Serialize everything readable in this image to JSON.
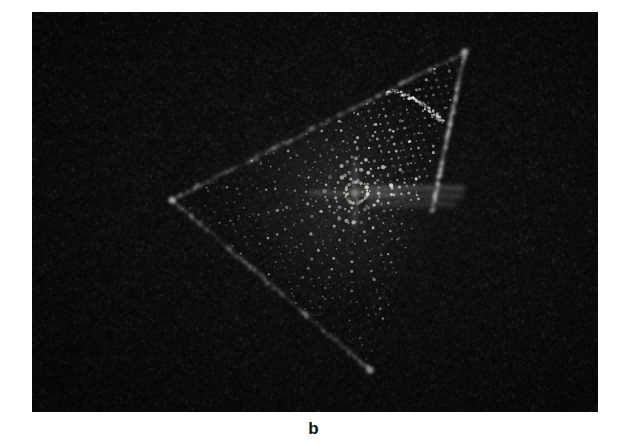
{
  "figure": {
    "panel_label": "b",
    "caption_position": "below-image",
    "background_color": "#fefefe",
    "plate": {
      "background_color": "#050505",
      "x": 32,
      "y": 12,
      "width": 566,
      "height": 400,
      "description": "electron diffraction pattern photographic plate"
    }
  },
  "chart_data": {
    "type": "scatter",
    "title": "",
    "subtitle": "",
    "xlabel": "",
    "ylabel": "",
    "grid": false,
    "legend": null,
    "annotations": [],
    "axis_ranges": {
      "x": [
        0,
        566
      ],
      "y": [
        0,
        400
      ]
    },
    "pattern": {
      "triangle_vertices_px": [
        [
          433,
          40
        ],
        [
          140,
          188
        ],
        [
          338,
          358
        ]
      ],
      "center_px": [
        323,
        181
      ],
      "bright_horizontal_streaks_px": [
        {
          "x1": 330,
          "y1": 176,
          "x2": 432,
          "y2": 176,
          "intensity": 0.8
        },
        {
          "x1": 332,
          "y1": 184,
          "x2": 430,
          "y2": 184,
          "intensity": 0.62
        },
        {
          "x1": 336,
          "y1": 192,
          "x2": 424,
          "y2": 192,
          "intensity": 0.5
        }
      ],
      "bright_edges": [
        {
          "name": "upper-left-edge",
          "from": [
            140,
            188
          ],
          "to": [
            433,
            40
          ],
          "intensity": 0.55
        },
        {
          "name": "right-edge",
          "from": [
            433,
            40
          ],
          "to": [
            400,
            200
          ],
          "intensity": 0.7
        },
        {
          "name": "lower-left-edge",
          "from": [
            140,
            188
          ],
          "to": [
            338,
            358
          ],
          "intensity": 0.45
        }
      ],
      "radial_fan": {
        "ray_count": 24,
        "angular_span_deg": 360,
        "spots_per_ray": 22
      },
      "dense_sector": {
        "name": "upper-right",
        "lattice_rows": 26,
        "lattice_cols": 26,
        "arc_radius_px": 110
      },
      "spot_color": "#f2f2ee",
      "spot_size_range_px": [
        0.6,
        2.6
      ]
    }
  }
}
